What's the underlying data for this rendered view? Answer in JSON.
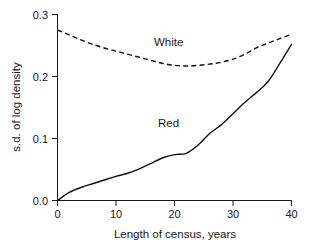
{
  "chart_data": {
    "type": "line",
    "title": "",
    "xlabel": "Length of census, years",
    "ylabel": "s.d. of log density",
    "xlim": [
      0,
      40
    ],
    "ylim": [
      0.0,
      0.3
    ],
    "grid": false,
    "legend_position": "inline-annotation",
    "xticks": [
      0,
      10,
      20,
      30,
      40
    ],
    "xtick_labels": [
      "0",
      "10",
      "20",
      "30",
      "40"
    ],
    "yticks": [
      0.0,
      0.1,
      0.2,
      0.3
    ],
    "ytick_labels": [
      "0.0",
      "0.1",
      "0.2",
      "0.3"
    ],
    "x": [
      0,
      2,
      4,
      6,
      8,
      10,
      12,
      14,
      16,
      18,
      20,
      22,
      24,
      26,
      28,
      30,
      32,
      34,
      36,
      38,
      40
    ],
    "series": [
      {
        "name": "White",
        "label": "White",
        "linestyle": "dashed",
        "color": "#101010",
        "values": [
          0.275,
          0.267,
          0.259,
          0.252,
          0.246,
          0.241,
          0.236,
          0.231,
          0.226,
          0.221,
          0.218,
          0.217,
          0.218,
          0.22,
          0.223,
          0.228,
          0.236,
          0.246,
          0.254,
          0.261,
          0.268
        ],
        "annotation": {
          "text": "White",
          "x": 19,
          "y": 0.25
        }
      },
      {
        "name": "Red",
        "label": "Red",
        "linestyle": "solid",
        "color": "#101010",
        "values": [
          0.0,
          0.013,
          0.021,
          0.027,
          0.033,
          0.039,
          0.044,
          0.051,
          0.06,
          0.069,
          0.074,
          0.076,
          0.089,
          0.108,
          0.122,
          0.14,
          0.158,
          0.174,
          0.192,
          0.221,
          0.252
        ],
        "annotation": {
          "text": "Red",
          "x": 19,
          "y": 0.118
        }
      }
    ]
  },
  "axes": {
    "y_axis_title": "s.d. of log density",
    "x_axis_title": "Length of census, years"
  }
}
